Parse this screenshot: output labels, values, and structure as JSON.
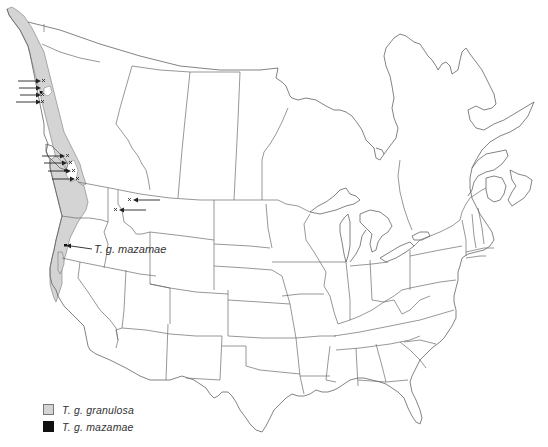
{
  "map": {
    "title": "Range map of Taricha granulosa subspecies",
    "region": "Canada and contiguous United States",
    "callout_label": "T. g. mazamae",
    "colors": {
      "granulosa_fill": "#d4d4d4",
      "mazamae_fill": "#111111",
      "boundary": "#6b6b6b"
    },
    "isolated_locality_groups": [
      {
        "area": "Alaska panhandle / northern British Columbia coast",
        "count": 4
      },
      {
        "area": "Vancouver Island / southern British Columbia coast",
        "count": 4
      },
      {
        "area": "Northern Idaho / western Montana",
        "count": 2
      }
    ]
  },
  "legend": {
    "items": [
      {
        "label": "T. g. granulosa",
        "color": "#d4d4d4",
        "symbol": "gray-square"
      },
      {
        "label": "T. g. mazamae",
        "color": "#111111",
        "symbol": "black-square"
      }
    ]
  }
}
